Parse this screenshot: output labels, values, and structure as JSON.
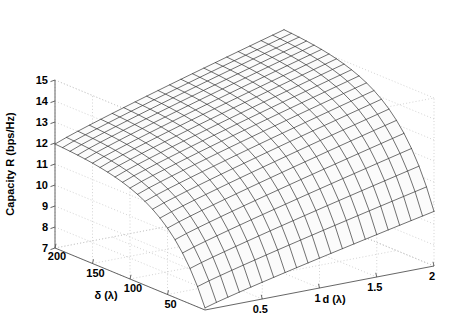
{
  "figure": {
    "type": "surface-plot-3d",
    "background_color": "#ffffff",
    "mesh_line_color": "#1a1a1a",
    "grid_color": "#c8c8c8",
    "axis_color": "#555555"
  },
  "chart_data": {
    "type": "surface",
    "title": "",
    "xlabel": "d (λ)",
    "ylabel": "δ (λ)",
    "zlabel": "Capacity R (bps/Hz)",
    "x_name": "d",
    "y_name": "delta",
    "z_name": "Capacity R",
    "xlim": [
      0,
      2
    ],
    "ylim": [
      0,
      200
    ],
    "zlim": [
      7,
      15
    ],
    "xticks": [
      0.5,
      1,
      1.5,
      2
    ],
    "xtick_labels": [
      "0.5",
      "1",
      "1.5",
      "2"
    ],
    "yticks": [
      200,
      150,
      100,
      50
    ],
    "ytick_labels": [
      "200",
      "150",
      "100",
      "50"
    ],
    "zticks": [
      7,
      8,
      9,
      10,
      11,
      12,
      13,
      14,
      15
    ],
    "ztick_labels": [
      "7",
      "8",
      "9",
      "10",
      "11",
      "12",
      "13",
      "14",
      "15"
    ],
    "grid": true,
    "legend": false,
    "mesh_divisions_x": 20,
    "mesh_divisions_y": 20,
    "corner_values": {
      "d0_delta0": 7.1,
      "d0_delta200": 11.95,
      "d2_delta0": 9.6,
      "d2_delta200": 15.3
    }
  },
  "axes": {
    "z_axis": {
      "name": "z-axis",
      "label": "Capacity R (bps/Hz)",
      "labels": [
        "15",
        "14",
        "13",
        "12",
        "11",
        "10",
        "9",
        "8",
        "7"
      ]
    },
    "y_axis": {
      "name": "delta-axis",
      "label": "δ (λ)",
      "labels": [
        "200",
        "150",
        "100",
        "50"
      ]
    },
    "x_axis": {
      "name": "d-axis",
      "label": "d (λ)",
      "labels": [
        "0.5",
        "1",
        "1.5",
        "2"
      ]
    }
  }
}
